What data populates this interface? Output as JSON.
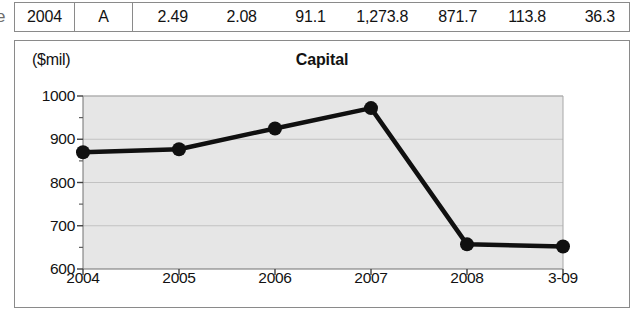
{
  "edge_fragment": "e",
  "table": {
    "columns": [
      "year",
      "grade",
      "v1",
      "v2",
      "v3",
      "v4",
      "v5",
      "v6",
      "v7"
    ],
    "row": {
      "year": "2004",
      "grade": "A",
      "v1": "2.49",
      "v2": "2.08",
      "v3": "91.1",
      "v4": "1,273.8",
      "v5": "871.7",
      "v6": "113.8",
      "v7": "36.3"
    }
  },
  "chart": {
    "unit_label": "($mil)",
    "title": "Capital"
  },
  "chart_data": {
    "type": "line",
    "title": "Capital",
    "xlabel": "",
    "ylabel": "($mil)",
    "unit": "$mil",
    "categories": [
      "2004",
      "2005",
      "2006",
      "2007",
      "2008",
      "3-09"
    ],
    "values": [
      870,
      877,
      925,
      972,
      657,
      652
    ],
    "ylim": [
      600,
      1000
    ],
    "ytick_labels": [
      "600",
      "700",
      "800",
      "900",
      "1000"
    ],
    "ytick_values": [
      600,
      700,
      800,
      900,
      1000
    ],
    "yminor_values": [
      650,
      750,
      850,
      950
    ],
    "grid": true,
    "legend": "none",
    "marker": "filled-circle",
    "line_color": "#101010",
    "plot_background": "#e6e6e6"
  }
}
